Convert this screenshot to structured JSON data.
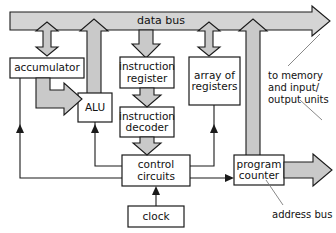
{
  "diagram": {
    "colors": {
      "bus_fill": "#d4d4d4",
      "arrow_fill": "#c9c9c9",
      "box_fill": "#ffffff",
      "stroke": "#1a1a1a",
      "text": "#111111"
    },
    "buses": [
      {
        "id": "data-bus",
        "label": "data bus",
        "direction": "right"
      },
      {
        "id": "address-bus",
        "label": "address bus",
        "direction": "right"
      }
    ],
    "blocks": [
      {
        "id": "accumulator",
        "label": "accumulator"
      },
      {
        "id": "alu",
        "label": "ALU"
      },
      {
        "id": "instruction-register",
        "label": "instruction\nregister"
      },
      {
        "id": "instruction-decoder",
        "label": "instruction\ndecoder"
      },
      {
        "id": "array-of-registers",
        "label": "array of\nregisters"
      },
      {
        "id": "control-circuits",
        "label": "control\ncircuits"
      },
      {
        "id": "clock",
        "label": "clock"
      },
      {
        "id": "program-counter",
        "label": "program\ncounter"
      }
    ],
    "annotations": [
      {
        "id": "to-memory-note",
        "label": "to memory\nand input/\noutput units"
      },
      {
        "id": "address-bus-note",
        "label": "address bus"
      }
    ],
    "connections": [
      {
        "from": "data-bus",
        "to": "accumulator",
        "style": "block-arrow",
        "direction": "bidirectional"
      },
      {
        "from": "alu",
        "to": "data-bus",
        "style": "block-arrow",
        "direction": "up"
      },
      {
        "from": "data-bus",
        "to": "instruction-register",
        "style": "block-arrow",
        "direction": "down"
      },
      {
        "from": "data-bus",
        "to": "array-of-registers",
        "style": "block-arrow",
        "direction": "bidirectional"
      },
      {
        "from": "program-counter",
        "to": "data-bus",
        "style": "block-arrow",
        "direction": "up"
      },
      {
        "from": "accumulator",
        "to": "alu",
        "style": "block-arrow",
        "direction": "right"
      },
      {
        "from": "instruction-register",
        "to": "instruction-decoder",
        "style": "block-arrow",
        "direction": "down"
      },
      {
        "from": "instruction-decoder",
        "to": "control-circuits",
        "style": "block-arrow",
        "direction": "down"
      },
      {
        "from": "control-circuits",
        "to": "accumulator",
        "style": "line",
        "direction": "up"
      },
      {
        "from": "control-circuits",
        "to": "alu",
        "style": "line",
        "direction": "up"
      },
      {
        "from": "control-circuits",
        "to": "array-of-registers",
        "style": "line",
        "direction": "up"
      },
      {
        "from": "control-circuits",
        "to": "program-counter",
        "style": "line",
        "direction": "right"
      },
      {
        "from": "clock",
        "to": "control-circuits",
        "style": "line",
        "direction": "up"
      },
      {
        "from": "program-counter",
        "to": "address-bus",
        "style": "block-arrow",
        "direction": "right"
      }
    ]
  }
}
